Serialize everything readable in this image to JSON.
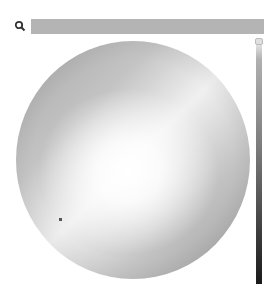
{
  "search": {
    "icon": "search-icon",
    "value": "",
    "placeholder": "",
    "fill_color": "#b4b4b4"
  },
  "color_wheel": {
    "type": "grayscale-wheel",
    "cursor": {
      "x": 60,
      "y": 219
    }
  },
  "brightness_slider": {
    "top_color": "#f2f2f2",
    "bottom_color": "#1a1a1a",
    "thumb_position": "top"
  }
}
